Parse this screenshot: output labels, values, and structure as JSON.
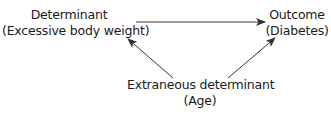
{
  "diagram": {
    "type": "causal-confounding-triangle",
    "nodes": [
      {
        "id": "determinant",
        "title": "Determinant",
        "subtitle": "(Excessive body weight)"
      },
      {
        "id": "outcome",
        "title": "Outcome",
        "subtitle": "(Diabetes)"
      },
      {
        "id": "extraneous",
        "title": "Extraneous determinant",
        "subtitle": "(Age)"
      }
    ],
    "edges": [
      {
        "from": "determinant",
        "to": "outcome"
      },
      {
        "from": "extraneous",
        "to": "determinant"
      },
      {
        "from": "extraneous",
        "to": "outcome"
      }
    ],
    "colors": {
      "line": "#333333",
      "text": "#1a1a1a",
      "background": "#ffffff"
    }
  }
}
